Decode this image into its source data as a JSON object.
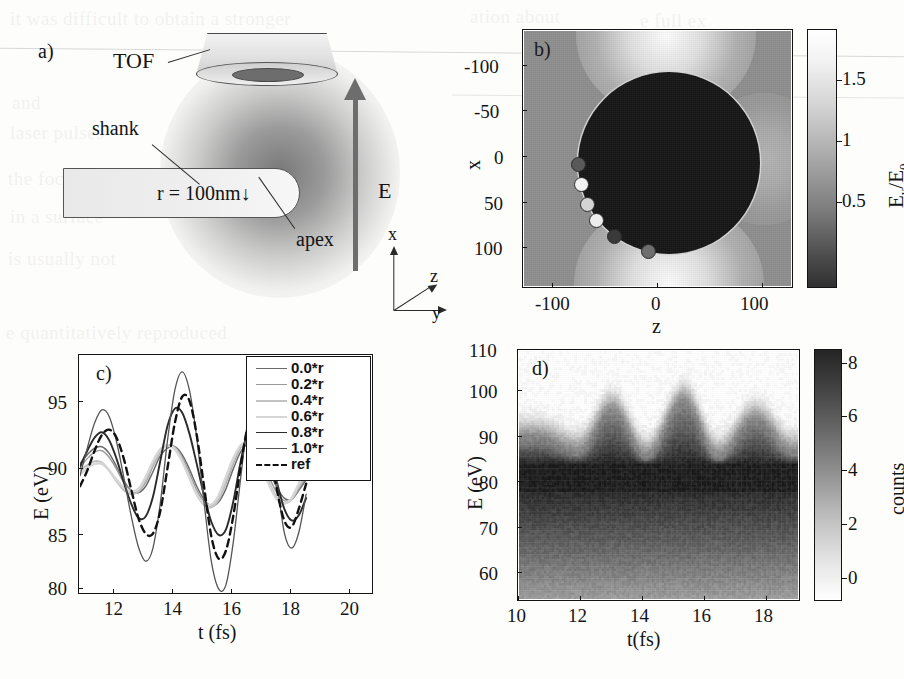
{
  "figure": {
    "panels": [
      "a",
      "b",
      "c",
      "d"
    ],
    "background": "#fdfdfc"
  },
  "panel_a": {
    "tag": "a)",
    "labels": {
      "tof": "TOF",
      "shank": "shank",
      "apex": "apex",
      "radius": "r = 100nm",
      "radius_arrow": "↓",
      "field": "E"
    },
    "axes_triad": {
      "x": "x",
      "y": "y",
      "z": "z"
    }
  },
  "panel_b": {
    "tag": "b)",
    "xlabel": "z",
    "ylabel": "x",
    "xticks": [
      "-100",
      "0",
      "100"
    ],
    "yticks": [
      "-100",
      "-50",
      "0",
      "50",
      "100"
    ],
    "colorbar": {
      "label": "E_y/E_0",
      "label_main": "E",
      "label_sub1": "y",
      "label_div": "/E",
      "label_sub2": "0",
      "ticks": [
        "1.5",
        "1",
        "0.5"
      ]
    },
    "chart_data": {
      "type": "heatmap",
      "title": "",
      "xlabel": "z",
      "ylabel": "x",
      "xlim": [
        -150,
        150
      ],
      "ylim": [
        -150,
        150
      ],
      "y_inverted": true,
      "zlabel": "E_y/E_0",
      "zlim": [
        0.2,
        1.8
      ],
      "ztick_values": [
        0.5,
        1,
        1.5
      ],
      "colormap": "gray",
      "description": "Near-field enhancement map around a 100 nm nanotip apex modelled as a sphere; field is zero inside the metal (dark disk, radius 100), background ~1 and bright lobes (up to ~1.8) at the top and bottom poles along y-polarisation.",
      "sphere": {
        "center": [
          0,
          0
        ],
        "radius": 100,
        "value": 0.0
      },
      "markers": {
        "note": "Launch positions of electron trajectories, shaded to match panel c legend entries",
        "points": [
          {
            "z": -98,
            "x": 0,
            "label": "0.0*r",
            "gray": "#595959"
          },
          {
            "z": -95,
            "x": 22,
            "label": "0.2*r",
            "gray": "#f2f2f2"
          },
          {
            "z": -88,
            "x": 44,
            "label": "0.4*r",
            "gray": "#d4d4d4"
          },
          {
            "z": -79,
            "x": 62,
            "label": "0.6*r",
            "gray": "#ededed"
          },
          {
            "z": -59,
            "x": 82,
            "label": "0.8*r",
            "gray": "#3a3a3a"
          },
          {
            "z": -22,
            "x": 99,
            "label": "1.0*r",
            "gray": "#6e6e6e"
          }
        ]
      }
    }
  },
  "panel_c": {
    "tag": "c)",
    "xlabel": "t (fs)",
    "ylabel": "E (eV)",
    "xticks": [
      "12",
      "14",
      "16",
      "18",
      "20"
    ],
    "yticks": [
      "95",
      "90",
      "85",
      "80"
    ],
    "legend": [
      {
        "label": "0.0*r",
        "color": "#6b6b6b",
        "width": 1.5,
        "dash": "none"
      },
      {
        "label": "0.2*r",
        "color": "#9a9a9a",
        "width": 1.4,
        "dash": "none"
      },
      {
        "label": "0.4*r",
        "color": "#c2c2c2",
        "width": 2.2,
        "dash": "none"
      },
      {
        "label": "0.6*r",
        "color": "#d6d6d6",
        "width": 2.4,
        "dash": "none"
      },
      {
        "label": "0.8*r",
        "color": "#2b2b2b",
        "width": 1.9,
        "dash": "none"
      },
      {
        "label": "1.0*r",
        "color": "#555555",
        "width": 1.3,
        "dash": "none"
      },
      {
        "label": "ref",
        "color": "#111111",
        "width": 2.4,
        "dash": "dashed"
      }
    ],
    "chart_data": {
      "type": "line",
      "title": "",
      "xlabel": "t (fs)",
      "ylabel": "E (eV)",
      "xlim": [
        11,
        21
      ],
      "ylim": [
        80,
        98
      ],
      "xtick_values": [
        12,
        14,
        16,
        18,
        20
      ],
      "ytick_values": [
        80,
        85,
        90,
        95
      ],
      "grid": false,
      "legend_position": "top-right",
      "x": [
        11.0,
        11.25,
        11.5,
        11.75,
        12.0,
        12.25,
        12.5,
        12.75,
        13.0,
        13.25,
        13.5,
        13.75,
        14.0,
        14.25,
        14.5,
        14.75,
        15.0,
        15.25,
        15.5,
        15.75,
        16.0,
        16.25,
        16.5,
        16.75,
        17.0,
        17.25,
        17.5,
        17.75,
        18.0,
        18.25,
        18.5,
        18.75
      ],
      "series": [
        {
          "name": "0.0*r",
          "color": "#6b6b6b",
          "values": [
            89.8,
            90.5,
            91.0,
            91.1,
            90.6,
            89.6,
            88.5,
            87.8,
            87.6,
            88.1,
            89.2,
            90.4,
            91.0,
            91.1,
            90.5,
            89.4,
            88.1,
            87.1,
            86.6,
            86.9,
            87.9,
            89.4,
            90.7,
            91.3,
            91.2,
            90.4,
            89.2,
            88.0,
            87.2,
            87.1,
            87.8,
            88.6
          ]
        },
        {
          "name": "0.2*r",
          "color": "#9a9a9a",
          "values": [
            89.5,
            90.2,
            90.7,
            90.8,
            90.3,
            89.4,
            88.4,
            87.8,
            87.7,
            88.4,
            89.6,
            90.7,
            91.2,
            91.1,
            90.3,
            89.1,
            87.8,
            86.9,
            86.6,
            87.1,
            88.3,
            89.8,
            91.0,
            91.4,
            91.0,
            90.0,
            88.7,
            87.6,
            87.0,
            87.1,
            87.9,
            88.8
          ]
        },
        {
          "name": "0.4*r",
          "color": "#c2c2c2",
          "values": [
            89.3,
            89.7,
            90.0,
            89.9,
            89.3,
            88.5,
            87.8,
            87.5,
            87.7,
            88.6,
            89.8,
            90.8,
            91.2,
            91.0,
            90.1,
            88.8,
            87.5,
            86.7,
            86.5,
            87.1,
            88.5,
            90.0,
            91.1,
            91.4,
            90.9,
            89.7,
            88.3,
            87.2,
            86.8,
            87.1,
            88.1,
            89.1
          ]
        },
        {
          "name": "0.6*r",
          "color": "#d6d6d6",
          "values": [
            89.0,
            89.5,
            89.8,
            89.8,
            89.3,
            88.6,
            88.0,
            87.7,
            87.9,
            88.8,
            90.0,
            90.9,
            91.2,
            90.9,
            90.0,
            88.7,
            87.5,
            86.8,
            86.7,
            87.4,
            88.8,
            90.2,
            91.2,
            91.4,
            90.8,
            89.5,
            88.1,
            87.1,
            86.8,
            87.2,
            88.3,
            89.3
          ]
        },
        {
          "name": "0.8*r",
          "color": "#2b2b2b",
          "values": [
            89.6,
            90.8,
            91.8,
            92.2,
            91.6,
            90.2,
            88.4,
            86.8,
            85.7,
            85.8,
            87.3,
            90.0,
            92.7,
            94.0,
            93.7,
            92.1,
            89.8,
            87.4,
            85.4,
            84.4,
            84.8,
            86.9,
            89.9,
            92.4,
            93.4,
            92.7,
            90.8,
            88.4,
            86.4,
            85.5,
            85.9,
            87.2
          ]
        },
        {
          "name": "1.0*r",
          "color": "#555555",
          "values": [
            88.9,
            91.0,
            92.9,
            93.9,
            93.4,
            91.5,
            88.8,
            85.9,
            83.5,
            82.4,
            83.4,
            86.8,
            91.6,
            95.4,
            96.8,
            95.4,
            91.8,
            86.9,
            82.4,
            80.3,
            80.6,
            83.8,
            88.6,
            93.1,
            95.7,
            95.4,
            92.6,
            88.4,
            84.6,
            83.4,
            84.6,
            87.5
          ]
        },
        {
          "name": "ref",
          "color": "#111111",
          "dash": "dashed",
          "values": [
            88.1,
            89.3,
            90.8,
            92.0,
            92.4,
            91.8,
            90.2,
            87.9,
            85.7,
            84.5,
            84.5,
            86.2,
            89.5,
            92.9,
            94.9,
            94.6,
            92.0,
            88.1,
            84.3,
            82.6,
            83.2,
            85.8,
            89.5,
            92.7,
            94.1,
            93.4,
            90.9,
            87.8,
            85.5,
            85.0,
            86.4,
            88.3
          ]
        }
      ]
    }
  },
  "panel_d": {
    "tag": "d)",
    "xlabel": "t(fs)",
    "ylabel": "E (eV)",
    "xticks": [
      "10",
      "12",
      "14",
      "16",
      "18"
    ],
    "yticks": [
      "110",
      "100",
      "90",
      "80",
      "70",
      "60"
    ],
    "colorbar": {
      "label": "counts",
      "ticks": [
        "8",
        "6",
        "4",
        "2",
        "0"
      ]
    },
    "chart_data": {
      "type": "heatmap",
      "title": "",
      "xlabel": "t(fs)",
      "ylabel": "E (eV)",
      "xlim": [
        10,
        19
      ],
      "ylim": [
        55,
        110
      ],
      "xtick_values": [
        10,
        12,
        14,
        16,
        18
      ],
      "ytick_values": [
        60,
        70,
        80,
        90,
        100,
        110
      ],
      "zlabel": "counts",
      "zlim": [
        0,
        9
      ],
      "ztick_values": [
        0,
        2,
        4,
        6,
        8
      ],
      "colormap": "gray_r",
      "description": "Measured photoelectron spectrogram: counts versus kinetic energy and delay. A dense dark band spans 60-85 eV with a sharp cutoff near 82 eV, and three periodic cutoff bursts reach ~98-100 eV near t = 13, 15.3 and 17.5 fs.",
      "cutoff_peaks": [
        {
          "t": 10.6,
          "E": 92
        },
        {
          "t": 13.0,
          "E": 98
        },
        {
          "t": 15.3,
          "E": 100
        },
        {
          "t": 17.6,
          "E": 96
        }
      ],
      "cutoff_minima": [
        {
          "t": 11.9,
          "E": 89
        },
        {
          "t": 14.1,
          "E": 88
        },
        {
          "t": 16.4,
          "E": 88
        },
        {
          "t": 18.8,
          "E": 89
        }
      ],
      "band": {
        "E_low": 55,
        "E_high": 85,
        "max_counts": 9
      }
    }
  },
  "bleed_text": [
    "it was difficult to obtain a stronger",
    "and",
    "laser pulses",
    "the focusing",
    "in a surface",
    "is usually not",
    "e quantitatively reproduced",
    "ation about",
    "e full ex",
    "mits t",
    "of the th"
  ]
}
